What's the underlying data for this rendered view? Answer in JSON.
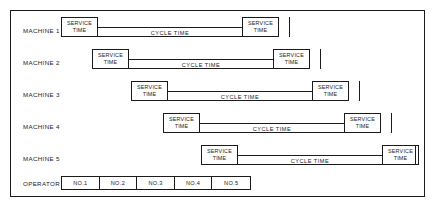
{
  "diagram": {
    "title": "",
    "type": "man-machine-multi-activity-chart",
    "colors": {
      "line": "#1b1b1b",
      "background": "#ffffff"
    },
    "labels": {
      "service_time": "SERVICE TIME",
      "service_time_line1": "SERVICE",
      "service_time_line2": "TIME",
      "cycle_time": "CYCLE  TIME",
      "operator": "OPERATOR"
    },
    "machines": [
      {
        "label": "MACHINE 1",
        "service_start": "SERVICE TIME",
        "cycle": "CYCLE  TIME",
        "service_end": "SERVICE TIME",
        "start_x": 50,
        "service_width": 37,
        "cycle_width": 144,
        "end_service_width": 37
      },
      {
        "label": "MACHINE 2",
        "service_start": "SERVICE TIME",
        "cycle": "CYCLE  TIME",
        "service_end": "SERVICE TIME",
        "start_x": 81,
        "service_width": 37,
        "cycle_width": 144,
        "end_service_width": 37
      },
      {
        "label": "MACHINE 3",
        "service_start": "SERVICE TIME",
        "cycle": "CYCLE  TIME",
        "service_end": "SERVICE TIME",
        "start_x": 120,
        "service_width": 37,
        "cycle_width": 144,
        "end_service_width": 37
      },
      {
        "label": "MACHINE 4",
        "service_start": "SERVICE TIME",
        "cycle": "CYCLE  TIME",
        "service_end": "SERVICE TIME",
        "start_x": 152,
        "service_width": 37,
        "cycle_width": 144,
        "end_service_width": 37
      },
      {
        "label": "MACHINE 5",
        "service_start": "SERVICE TIME",
        "cycle": "CYCLE  TIME",
        "service_end": "SERVICE TIME",
        "start_x": 190,
        "service_width": 37,
        "cycle_width": 144,
        "end_service_width": 37
      }
    ],
    "operator_row": {
      "label": "OPERATOR",
      "start_x": 50,
      "cell_width": 38,
      "cells": [
        {
          "label": "NO.1"
        },
        {
          "label": "NO.2"
        },
        {
          "label": "NO.3"
        },
        {
          "label": "NO.4"
        },
        {
          "label": "NO.5"
        }
      ]
    }
  }
}
